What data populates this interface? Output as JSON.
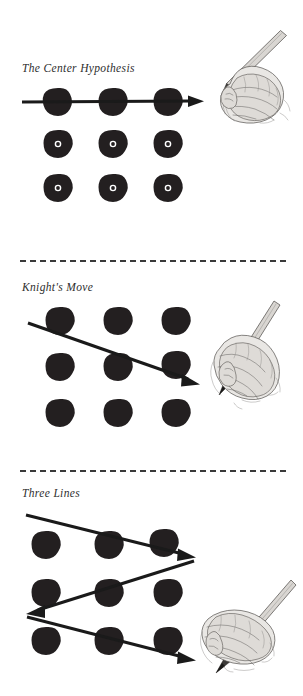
{
  "page": {
    "background_color": "#ffffff",
    "ink_color": "#231f20",
    "divider_color": "#3a3a3a",
    "width": 303,
    "height": 696
  },
  "sections": [
    {
      "id": "center-hypothesis",
      "title": "The Center Hypothesis",
      "divider_above": false,
      "puzzle": {
        "rows": 3,
        "cols": 3,
        "dot_color": "#231f20",
        "dots_with_center_mark": [
          "row2",
          "row3"
        ],
        "center_mark_color": "#ffffff"
      },
      "strokes": [
        {
          "name": "horizontal-line-through-top-row",
          "from": [
            0,
            0
          ],
          "to": [
            3,
            0
          ],
          "arrow": "end"
        }
      ],
      "hand_illustration": {
        "name": "hand-holding-pencil-sketch",
        "pencil_direction": "up-right",
        "position": "top-right"
      }
    },
    {
      "id": "knights-move",
      "title": "Knight's Move",
      "divider_above": true,
      "puzzle": {
        "rows": 3,
        "cols": 3,
        "dot_color": "#231f20",
        "dots_with_center_mark": [],
        "center_mark_color": "#ffffff"
      },
      "strokes": [
        {
          "name": "diagonal-line-top-left-to-mid-right",
          "from": [
            0,
            0
          ],
          "to": [
            3,
            1
          ],
          "arrow": "end"
        }
      ],
      "hand_illustration": {
        "name": "hand-holding-pencil-sketch",
        "pencil_direction": "up-right",
        "position": "middle-right"
      }
    },
    {
      "id": "three-lines",
      "title": "Three Lines",
      "divider_above": true,
      "puzzle": {
        "rows": 3,
        "cols": 3,
        "dot_color": "#231f20",
        "dots_with_center_mark": [],
        "center_mark_color": "#ffffff"
      },
      "strokes": [
        {
          "name": "zigzag-line-1-down-right",
          "from": [
            0,
            0
          ],
          "to": [
            3,
            1
          ],
          "arrow": "end"
        },
        {
          "name": "zigzag-line-2-down-left",
          "from": [
            3,
            1
          ],
          "to": [
            0,
            2
          ],
          "arrow": "end"
        },
        {
          "name": "zigzag-line-3-down-right",
          "from": [
            0,
            2
          ],
          "to": [
            3,
            3
          ],
          "arrow": "end"
        }
      ],
      "hand_illustration": {
        "name": "hand-holding-pencil-sketch",
        "pencil_direction": "up-right",
        "position": "bottom-right"
      }
    }
  ]
}
